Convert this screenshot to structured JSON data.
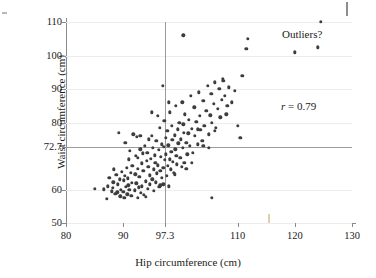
{
  "chart_data": {
    "type": "scatter",
    "title": "",
    "xlabel": "Hip circumference (cm)",
    "ylabel": "Waist circumference (cm)",
    "xlim": [
      80,
      130
    ],
    "ylim": [
      50,
      110
    ],
    "xticks": [
      80,
      90,
      97.3,
      110,
      120,
      130
    ],
    "xtick_labels": [
      "80",
      "90",
      "97.3",
      "110",
      "120",
      "130"
    ],
    "yticks": [
      50,
      60,
      72.7,
      80,
      90,
      100,
      110
    ],
    "ytick_labels": [
      "50",
      "60",
      "72.7",
      "80",
      "90",
      "100",
      "110"
    ],
    "grid": true,
    "grid_axis": "y",
    "legend": "none",
    "reference_lines": [
      {
        "axis": "x",
        "value": 97.3,
        "label": "97.3",
        "color": "#9a9a9a"
      },
      {
        "axis": "y",
        "value": 72.7,
        "label": "72.7",
        "color": "#9a9a9a"
      }
    ],
    "annotations": [
      {
        "text": "Outliers?",
        "x": 121.5,
        "y": 105.0
      },
      {
        "text": "r = 0.79",
        "x": 121.0,
        "y": 84.5
      }
    ],
    "correlation": 0.79,
    "marker_color": "#3d3d3d",
    "n_points": 181,
    "points": [
      [
        85.0,
        60.2
      ],
      [
        86.6,
        60.1
      ],
      [
        87.1,
        57.3
      ],
      [
        87.3,
        61.0
      ],
      [
        87.6,
        63.5
      ],
      [
        88.0,
        59.5
      ],
      [
        88.2,
        60.5
      ],
      [
        88.3,
        62.2
      ],
      [
        88.4,
        66.0
      ],
      [
        88.6,
        58.8
      ],
      [
        88.8,
        64.3
      ],
      [
        89.0,
        59.2
      ],
      [
        89.1,
        61.5
      ],
      [
        89.2,
        77.0
      ],
      [
        89.4,
        63.0
      ],
      [
        89.5,
        58.0
      ],
      [
        89.6,
        60.0
      ],
      [
        89.8,
        65.2
      ],
      [
        90.0,
        59.4
      ],
      [
        90.1,
        62.8
      ],
      [
        90.2,
        57.5
      ],
      [
        90.3,
        64.0
      ],
      [
        90.4,
        74.0
      ],
      [
        90.5,
        60.8
      ],
      [
        90.6,
        66.5
      ],
      [
        90.7,
        58.6
      ],
      [
        90.8,
        63.3
      ],
      [
        90.9,
        61.2
      ],
      [
        91.0,
        69.0
      ],
      [
        91.1,
        60.0
      ],
      [
        91.2,
        71.5
      ],
      [
        91.3,
        65.0
      ],
      [
        91.4,
        58.2
      ],
      [
        91.5,
        62.0
      ],
      [
        91.6,
        67.0
      ],
      [
        91.8,
        76.5
      ],
      [
        92.0,
        59.8
      ],
      [
        92.1,
        64.5
      ],
      [
        92.2,
        70.0
      ],
      [
        92.3,
        61.8
      ],
      [
        92.4,
        75.8
      ],
      [
        92.5,
        66.2
      ],
      [
        92.6,
        69.5
      ],
      [
        92.7,
        60.6
      ],
      [
        92.8,
        63.8
      ],
      [
        93.0,
        72.0
      ],
      [
        93.1,
        59.0
      ],
      [
        93.2,
        67.8
      ],
      [
        93.3,
        61.0
      ],
      [
        93.4,
        70.8
      ],
      [
        93.5,
        65.5
      ],
      [
        93.6,
        58.5
      ],
      [
        93.8,
        73.0
      ],
      [
        94.0,
        62.5
      ],
      [
        94.1,
        68.5
      ],
      [
        94.2,
        71.0
      ],
      [
        94.3,
        60.2
      ],
      [
        94.4,
        66.8
      ],
      [
        94.5,
        75.0
      ],
      [
        94.6,
        64.2
      ],
      [
        94.7,
        61.5
      ],
      [
        94.8,
        69.2
      ],
      [
        95.0,
        76.0
      ],
      [
        95.1,
        63.0
      ],
      [
        95.2,
        72.5
      ],
      [
        95.3,
        66.0
      ],
      [
        95.4,
        59.6
      ],
      [
        95.5,
        70.2
      ],
      [
        95.6,
        68.0
      ],
      [
        95.7,
        62.2
      ],
      [
        95.8,
        74.5
      ],
      [
        95.9,
        64.8
      ],
      [
        96.0,
        82.0
      ],
      [
        96.1,
        67.2
      ],
      [
        96.2,
        71.8
      ],
      [
        96.3,
        60.8
      ],
      [
        96.4,
        78.5
      ],
      [
        96.5,
        65.6
      ],
      [
        96.6,
        69.8
      ],
      [
        96.7,
        73.5
      ],
      [
        96.8,
        63.5
      ],
      [
        96.9,
        91.0
      ],
      [
        97.0,
        66.5
      ],
      [
        97.1,
        72.8
      ],
      [
        97.2,
        80.5
      ],
      [
        97.3,
        68.8
      ],
      [
        97.4,
        75.5
      ],
      [
        97.5,
        70.5
      ],
      [
        97.6,
        64.0
      ],
      [
        97.7,
        77.5
      ],
      [
        97.8,
        67.0
      ],
      [
        97.9,
        73.2
      ],
      [
        98.0,
        61.0
      ],
      [
        98.1,
        69.0
      ],
      [
        98.2,
        83.0
      ],
      [
        98.3,
        66.0
      ],
      [
        98.4,
        71.2
      ],
      [
        98.5,
        79.0
      ],
      [
        98.6,
        74.8
      ],
      [
        98.7,
        68.2
      ],
      [
        98.8,
        65.0
      ],
      [
        99.0,
        76.2
      ],
      [
        99.1,
        72.0
      ],
      [
        99.2,
        85.0
      ],
      [
        99.3,
        70.0
      ],
      [
        99.4,
        67.5
      ],
      [
        99.5,
        78.0
      ],
      [
        99.6,
        73.8
      ],
      [
        99.8,
        80.0
      ],
      [
        100.0,
        69.5
      ],
      [
        100.1,
        75.0
      ],
      [
        100.2,
        66.8
      ],
      [
        100.3,
        86.0
      ],
      [
        100.4,
        72.5
      ],
      [
        100.5,
        79.5
      ],
      [
        100.6,
        77.0
      ],
      [
        100.7,
        68.0
      ],
      [
        100.8,
        82.5
      ],
      [
        101.0,
        74.0
      ],
      [
        101.2,
        70.5
      ],
      [
        101.4,
        76.8
      ],
      [
        101.5,
        80.8
      ],
      [
        101.6,
        73.0
      ],
      [
        101.8,
        88.0
      ],
      [
        102.0,
        78.2
      ],
      [
        102.2,
        71.0
      ],
      [
        102.4,
        84.5
      ],
      [
        102.5,
        76.0
      ],
      [
        102.8,
        80.2
      ],
      [
        103.0,
        73.5
      ],
      [
        103.2,
        89.0
      ],
      [
        103.4,
        82.0
      ],
      [
        103.5,
        77.8
      ],
      [
        103.8,
        74.5
      ],
      [
        104.0,
        86.5
      ],
      [
        104.2,
        79.0
      ],
      [
        104.5,
        83.5
      ],
      [
        104.8,
        91.0
      ],
      [
        105.0,
        76.5
      ],
      [
        105.2,
        82.2
      ],
      [
        105.4,
        88.5
      ],
      [
        105.5,
        80.0
      ],
      [
        105.8,
        85.5
      ],
      [
        106.0,
        92.0
      ],
      [
        106.2,
        78.5
      ],
      [
        106.5,
        84.0
      ],
      [
        106.8,
        90.0
      ],
      [
        107.0,
        81.5
      ],
      [
        107.2,
        86.8
      ],
      [
        107.4,
        93.0
      ],
      [
        107.5,
        92.5
      ],
      [
        107.8,
        88.0
      ],
      [
        108.0,
        82.5
      ],
      [
        108.2,
        85.0
      ],
      [
        108.5,
        90.5
      ],
      [
        104.0,
        73.0
      ],
      [
        105.0,
        72.5
      ],
      [
        103.0,
        78.0
      ],
      [
        106.0,
        77.5
      ],
      [
        109.0,
        86.0
      ],
      [
        109.5,
        89.5
      ],
      [
        110.0,
        79.0
      ],
      [
        110.5,
        75.5
      ],
      [
        110.8,
        94.0
      ],
      [
        111.5,
        102.0
      ],
      [
        111.8,
        105.0
      ],
      [
        100.5,
        106.0
      ],
      [
        124.5,
        110.0
      ],
      [
        124.0,
        102.5
      ],
      [
        120.0,
        101.0
      ],
      [
        105.5,
        57.5
      ],
      [
        97.0,
        61.5
      ],
      [
        96.5,
        61.2
      ],
      [
        94.0,
        57.8
      ],
      [
        92.5,
        57.6
      ],
      [
        99.0,
        64.5
      ],
      [
        101.0,
        66.2
      ],
      [
        102.0,
        68.0
      ],
      [
        93.0,
        76.0
      ],
      [
        95.0,
        83.0
      ],
      [
        98.0,
        86.0
      ]
    ]
  }
}
